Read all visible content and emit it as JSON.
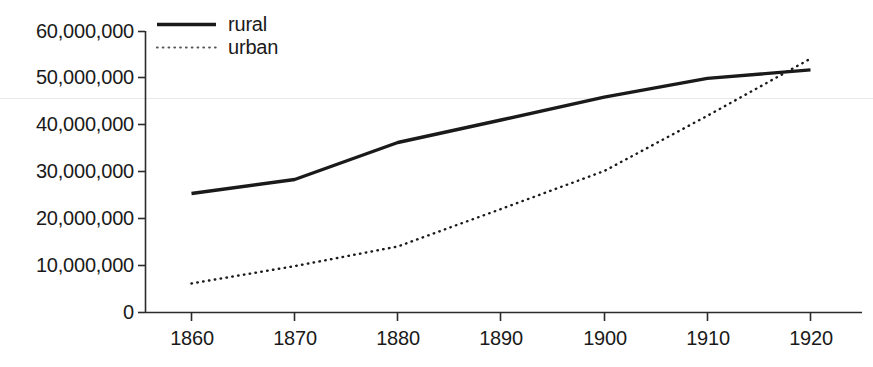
{
  "chart_data": {
    "type": "line",
    "title": "",
    "subtitle": "",
    "xlabel": "",
    "ylabel": "",
    "categories": [
      1860,
      1870,
      1880,
      1890,
      1900,
      1910,
      1920
    ],
    "x": [
      1860,
      1870,
      1880,
      1890,
      1900,
      1910,
      1920
    ],
    "xlim": [
      1860,
      1920
    ],
    "ylim": [
      0,
      60000000
    ],
    "grid": false,
    "legend_position": "top-left-inside",
    "series": [
      {
        "name": "rural",
        "style": "solid",
        "color": "#1a1a1a",
        "values": [
          25400000,
          28400000,
          36300000,
          41100000,
          46000000,
          50000000,
          51800000
        ]
      },
      {
        "name": "urban",
        "style": "dotted",
        "color": "#1a1a1a",
        "values": [
          6200000,
          9900000,
          14100000,
          22100000,
          30200000,
          42000000,
          54200000
        ]
      }
    ],
    "y_tick_labels": [
      "0",
      "10,000,000",
      "20,000,000",
      "30,000,000",
      "40,000,000",
      "50,000,000",
      "60,000,000"
    ],
    "y_tick_values": [
      0,
      10000000,
      20000000,
      30000000,
      40000000,
      50000000,
      60000000
    ],
    "x_tick_labels": [
      "1860",
      "1870",
      "1880",
      "1890",
      "1900",
      "1910",
      "1920"
    ],
    "x_tick_values": [
      1860,
      1870,
      1880,
      1890,
      1900,
      1910,
      1920
    ],
    "annotations": []
  },
  "legend": {
    "entries": [
      {
        "label": "rural",
        "style": "solid"
      },
      {
        "label": "urban",
        "style": "dotted"
      }
    ]
  },
  "colors": {
    "background": "#ffffff",
    "axis": "#2b2b2b",
    "series": "#1a1a1a",
    "artifact_line": "#e8e8e8"
  }
}
